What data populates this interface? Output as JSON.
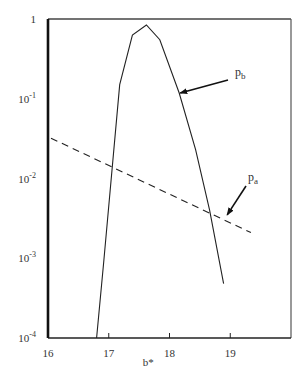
{
  "chart_data": {
    "type": "line",
    "title": "",
    "xlabel": "b*",
    "ylabel": "",
    "xlim": [
      16,
      20
    ],
    "ylim": [
      0.0001,
      1
    ],
    "yscale": "log",
    "grid": false,
    "legend": "none (inline arrow annotations)",
    "x_ticks": [
      16,
      17,
      18,
      19
    ],
    "x_tick_labels": [
      "16",
      "17",
      "18",
      "19"
    ],
    "y_ticks": [
      1,
      0.1,
      0.01,
      0.001,
      0.0001
    ],
    "y_tick_labels": [
      {
        "base": "1",
        "exp": ""
      },
      {
        "base": "10",
        "exp": "-1"
      },
      {
        "base": "10",
        "exp": "-2"
      },
      {
        "base": "10",
        "exp": "-3"
      },
      {
        "base": "10",
        "exp": "-4"
      }
    ],
    "series": [
      {
        "name": "p_b",
        "label_main": "p",
        "label_sub": "b",
        "style": "solid",
        "x": [
          16.8,
          16.92,
          17.18,
          17.39,
          17.62,
          17.84,
          18.16,
          18.43,
          18.66,
          18.89
        ],
        "y": [
          0.0001,
          0.00095,
          0.15,
          0.63,
          0.84,
          0.55,
          0.118,
          0.023,
          0.004,
          0.00048
        ]
      },
      {
        "name": "p_a",
        "label_main": "p",
        "label_sub": "a",
        "style": "dashed",
        "x": [
          16.05,
          19.34
        ],
        "y": [
          0.032,
          0.0021
        ]
      }
    ],
    "annotations": [
      {
        "text": "p_b",
        "arrow_to": [
          18.16,
          0.118
        ]
      },
      {
        "text": "p_a",
        "arrow_to": [
          18.95,
          0.0035
        ]
      }
    ]
  }
}
